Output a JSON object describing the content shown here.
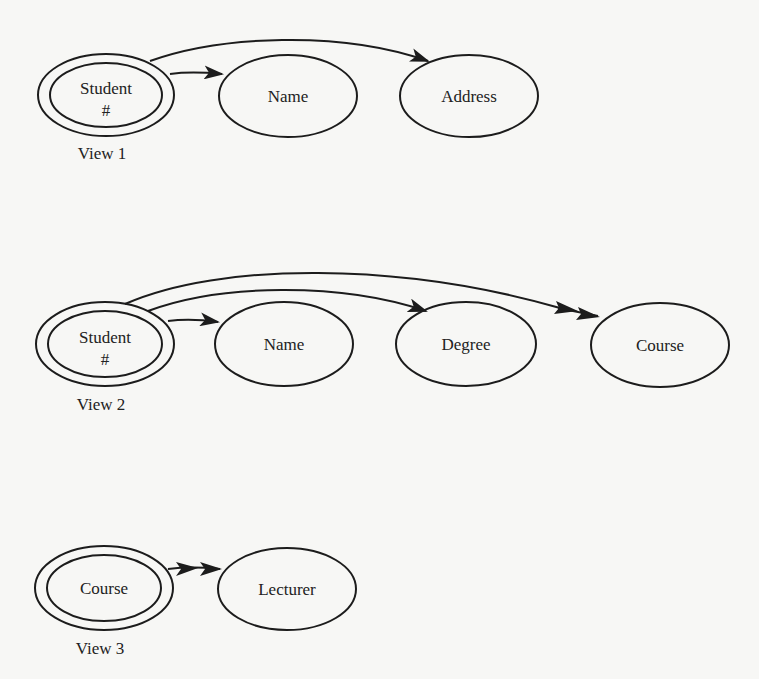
{
  "diagram": {
    "type": "functional-dependency-views",
    "views": [
      {
        "label": "View 1",
        "key": {
          "label_line1": "Student",
          "label_line2": "#"
        },
        "attributes": [
          {
            "label": "Name",
            "arrow": "single"
          },
          {
            "label": "Address",
            "arrow": "single"
          }
        ]
      },
      {
        "label": "View 2",
        "key": {
          "label_line1": "Student",
          "label_line2": "#"
        },
        "attributes": [
          {
            "label": "Name",
            "arrow": "single"
          },
          {
            "label": "Degree",
            "arrow": "single"
          },
          {
            "label": "Course",
            "arrow": "double"
          }
        ]
      },
      {
        "label": "View 3",
        "key": {
          "label_line1": "Course",
          "label_line2": ""
        },
        "attributes": [
          {
            "label": "Lecturer",
            "arrow": "double"
          }
        ]
      }
    ]
  },
  "colors": {
    "background": "#f7f7f5",
    "stroke": "#1c1c1c",
    "text": "#222222"
  }
}
